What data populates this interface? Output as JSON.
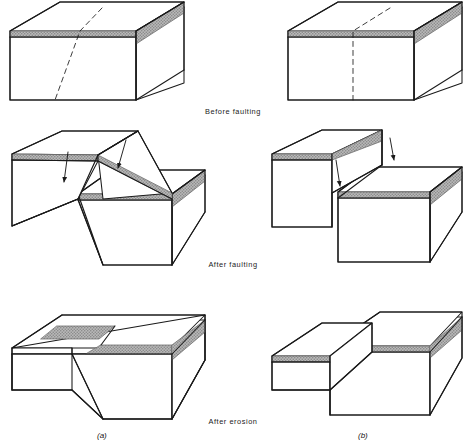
{
  "figure": {
    "background_color": "#ffffff",
    "line_color": "#1a1a1a",
    "marker_bed_color": "#a8a8a8",
    "marker_bed_edge_color": "#6f6f6f",
    "face_color": "#ffffff",
    "width": 466,
    "height": 446
  },
  "stages": [
    {
      "id": "before-faulting",
      "label": "Before faulting"
    },
    {
      "id": "after-faulting",
      "label": "After faulting"
    },
    {
      "id": "after-erosion",
      "label": "After erosion"
    }
  ],
  "panels": [
    {
      "id": "a",
      "label": "(a)",
      "fault_type": "inclined normal fault"
    },
    {
      "id": "b",
      "label": "(b)",
      "fault_type": "vertical fault"
    }
  ],
  "blocks": [
    {
      "id": "a-before",
      "panel": "a",
      "stage": "before-faulting",
      "description": "Intact block with inclined dashed fault trace and stippled marker bed",
      "fault_trace": "inclined dashed",
      "has_marker_bed": true,
      "arrows": 0
    },
    {
      "id": "b-before",
      "panel": "b",
      "stage": "before-faulting",
      "description": "Intact block with vertical dashed fault trace and stippled marker bed",
      "fault_trace": "vertical dashed",
      "has_marker_bed": true,
      "arrows": 0
    },
    {
      "id": "a-after-faulting",
      "panel": "a",
      "stage": "after-faulting",
      "description": "Hanging wall dropped along inclined fault plane, marker bed offset",
      "fault_trace": "inclined solid",
      "has_marker_bed": true,
      "arrows": 2
    },
    {
      "id": "b-after-faulting",
      "panel": "b",
      "stage": "after-faulting",
      "description": "Right block dropped along vertical fault plane, marker bed offset",
      "fault_trace": "vertical solid",
      "has_marker_bed": true,
      "arrows": 1
    },
    {
      "id": "a-after-erosion",
      "panel": "a",
      "stage": "after-erosion",
      "description": "Planed-off surface across inclined fault, marker bed outcrops offset",
      "fault_trace": "inclined solid",
      "has_marker_bed": true,
      "arrows": 0
    },
    {
      "id": "b-after-erosion",
      "panel": "b",
      "stage": "after-erosion",
      "description": "Planed-off surface across vertical fault, marker bed outcrops offset",
      "fault_trace": "vertical solid",
      "has_marker_bed": true,
      "arrows": 0
    }
  ]
}
